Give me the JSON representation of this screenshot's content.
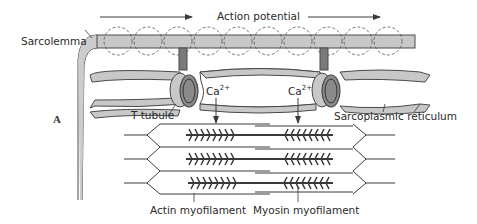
{
  "figure": {
    "panel_label": "A",
    "labels": {
      "action_potential": "Action potential",
      "sarcolemma": "Sarcolemma",
      "t_tubule": "T tubule",
      "ca_left": "Ca",
      "ca_right": "Ca",
      "ca_charge": "2+",
      "sarcoplasmic_reticulum": "Sarcoplasmic reticulum",
      "actin": "Actin myofilament",
      "myosin": "Myosin myofilament"
    },
    "colors": {
      "membrane_fill": "#c8c8c8",
      "membrane_stroke": "#4a4a4a",
      "tubule_dark": "#7a7a7a",
      "line": "#3a3a3a",
      "background": "#ffffff"
    }
  }
}
